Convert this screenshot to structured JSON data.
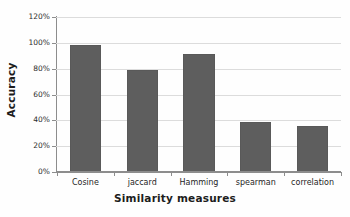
{
  "chart_data": {
    "type": "bar",
    "title": "",
    "xlabel": "Similarity measures",
    "ylabel": "Accuracy",
    "categories": [
      "Cosine",
      "jaccard",
      "Hamming",
      "spearman",
      "correlation"
    ],
    "values": [
      98,
      79,
      91,
      39,
      36
    ],
    "series": [
      {
        "name": "Accuracy",
        "values": [
          98,
          79,
          91,
          39,
          36
        ]
      }
    ],
    "ylim": [
      0,
      120
    ],
    "ytick_step": 20,
    "ytick_labels": [
      "0%",
      "20%",
      "40%",
      "60%",
      "80%",
      "100%",
      "120%"
    ],
    "ytick_values": [
      0,
      20,
      40,
      60,
      80,
      100,
      120
    ],
    "value_unit": "%",
    "grid": true,
    "grid_axis": "y",
    "legend": false,
    "legend_position": "none",
    "bar_color": "#5e5e5e",
    "gridline_color": "#dcdcdc",
    "axis_color": "#8d8d8d",
    "background_color": "#fefefe"
  }
}
